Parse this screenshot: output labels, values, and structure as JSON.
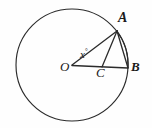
{
  "figure": {
    "background_color": "#fefefe",
    "stroke_color": "#262626",
    "labels": {
      "center": "O",
      "point_a": "A",
      "point_b": "B",
      "point_c": "C",
      "angle_value": "x",
      "angle_unit": "°"
    },
    "geometry": {
      "circle": {
        "cx": 72,
        "cy": 65,
        "r": 56
      },
      "points": {
        "O": {
          "x": 72,
          "y": 65
        },
        "A": {
          "x": 117,
          "y": 31
        },
        "B": {
          "x": 128,
          "y": 68
        },
        "C": {
          "x": 102,
          "y": 67
        }
      },
      "segments": [
        {
          "name": "OA",
          "from": "O",
          "to": "A"
        },
        {
          "name": "OB",
          "from": "O",
          "to": "B"
        },
        {
          "name": "AC",
          "from": "A",
          "to": "C"
        },
        {
          "name": "AB",
          "from": "A",
          "to": "B"
        }
      ]
    }
  }
}
